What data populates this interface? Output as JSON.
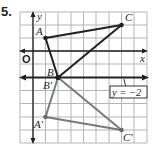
{
  "problem": {
    "number": "5."
  },
  "axes": {
    "x_label": "x",
    "y_label": "y",
    "origin_label": "O"
  },
  "reflection_line": {
    "label": "y = −2",
    "y": -2
  },
  "original": {
    "points": [
      {
        "name": "A",
        "x": 1,
        "y": 1
      },
      {
        "name": "B",
        "x": 2,
        "y": -2
      },
      {
        "name": "C",
        "x": 7,
        "y": 2
      }
    ],
    "color": "#231f20"
  },
  "image": {
    "points": [
      {
        "name": "A′",
        "x": 1,
        "y": -5
      },
      {
        "name": "B′",
        "x": 2,
        "y": -2
      },
      {
        "name": "C′",
        "x": 7,
        "y": -6
      }
    ],
    "color": "#7a7a7a"
  },
  "grid": {
    "x_range": [
      -1,
      8
    ],
    "y_range": [
      -7,
      3
    ],
    "line_color": "#b5b5b5"
  }
}
